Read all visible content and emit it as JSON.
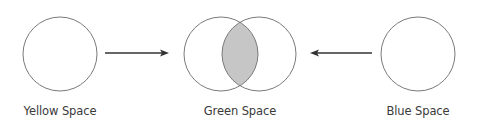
{
  "diagram": {
    "colors": {
      "stroke": "#7a7a7a",
      "intersection_fill": "#c6c6c6",
      "arrow": "#333333",
      "label": "#3a3a3a"
    },
    "nodes": [
      {
        "id": "yellow",
        "label": "Yellow Space",
        "cx": 60,
        "cy": 54,
        "r": 37
      },
      {
        "id": "green",
        "label": "Green Space",
        "circles": [
          {
            "cx": 221,
            "cy": 54,
            "r": 37
          },
          {
            "cx": 259,
            "cy": 54,
            "r": 37
          }
        ],
        "intersection_shaded": true
      },
      {
        "id": "blue",
        "label": "Blue Space",
        "cx": 418,
        "cy": 54,
        "r": 37
      }
    ],
    "edges": [
      {
        "from": "yellow",
        "to": "green",
        "direction": "right"
      },
      {
        "from": "blue",
        "to": "green",
        "direction": "left"
      }
    ]
  }
}
